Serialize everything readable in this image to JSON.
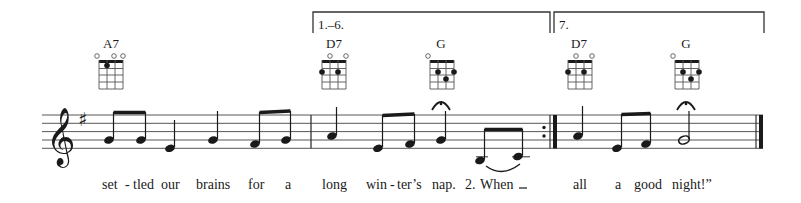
{
  "score": {
    "clef": "treble",
    "key_signature": "G major (1 sharp: F#)",
    "colors": {
      "ink": "#1a1a1a",
      "background": "#ffffff"
    }
  },
  "endings": [
    {
      "label": "1.–6.",
      "x_start": 313,
      "x_end": 550
    },
    {
      "label": "7.",
      "x_start": 555,
      "x_end": 765
    }
  ],
  "chords": [
    {
      "name": "A7",
      "x": 117,
      "open_strings": [
        0,
        2,
        3
      ],
      "dots": [
        {
          "string": 1,
          "fret": 1
        }
      ]
    },
    {
      "name": "D7",
      "x": 333,
      "open_strings": [
        1,
        3
      ],
      "dots": [
        {
          "string": 0,
          "fret": 2
        },
        {
          "string": 2,
          "fret": 2
        }
      ]
    },
    {
      "name": "G",
      "x": 441,
      "open_strings": [
        0
      ],
      "dots": [
        {
          "string": 1,
          "fret": 2
        },
        {
          "string": 3,
          "fret": 2
        },
        {
          "string": 2,
          "fret": 3
        }
      ]
    },
    {
      "name": "D7",
      "x": 580,
      "open_strings": [
        1,
        3
      ],
      "dots": [
        {
          "string": 0,
          "fret": 2
        },
        {
          "string": 2,
          "fret": 2
        }
      ]
    },
    {
      "name": "G",
      "x": 686,
      "open_strings": [
        0
      ],
      "dots": [
        {
          "string": 1,
          "fret": 2
        },
        {
          "string": 3,
          "fret": 2
        },
        {
          "string": 2,
          "fret": 3
        }
      ]
    }
  ],
  "lyrics": [
    {
      "text": "set",
      "x": 102
    },
    {
      "text": "-",
      "x": 125
    },
    {
      "text": "tled",
      "x": 133
    },
    {
      "text": "our",
      "x": 161
    },
    {
      "text": "brains",
      "x": 196
    },
    {
      "text": "for",
      "x": 248
    },
    {
      "text": "a",
      "x": 285
    },
    {
      "text": "long",
      "x": 322
    },
    {
      "text": "win",
      "x": 366
    },
    {
      "text": "-",
      "x": 391
    },
    {
      "text": "ter’s",
      "x": 396
    },
    {
      "text": "nap.",
      "x": 432
    },
    {
      "text": "2.",
      "x": 465
    },
    {
      "text": "When",
      "x": 480
    },
    {
      "text": "all",
      "x": 573
    },
    {
      "text": "a",
      "x": 615
    },
    {
      "text": "good",
      "x": 634
    },
    {
      "text": "night!”",
      "x": 672
    }
  ]
}
